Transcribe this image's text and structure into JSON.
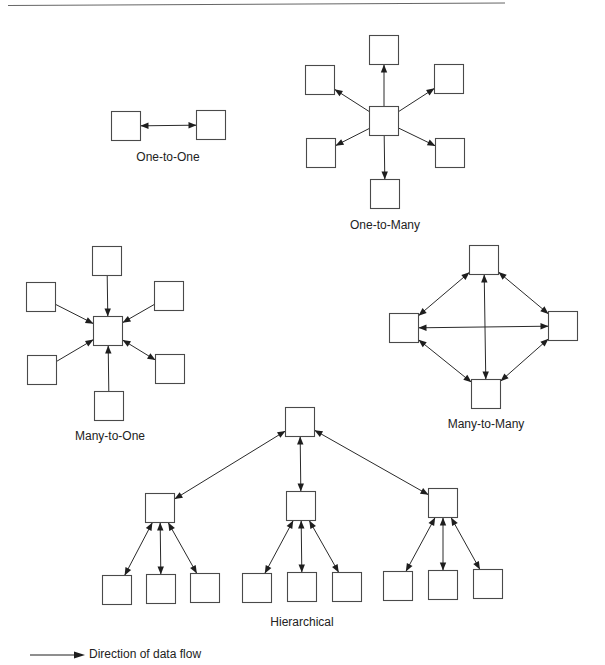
{
  "diagrams": {
    "one_to_one": {
      "label": "One-to-One",
      "center": [
        168,
        126
      ],
      "nodes": [
        [
          126,
          126
        ],
        [
          211,
          125
        ]
      ],
      "edges": [
        {
          "from": 0,
          "to": 1,
          "type": "both"
        }
      ]
    },
    "one_to_many": {
      "label": "One-to-Many",
      "hub": [
        384,
        121
      ],
      "leaves": [
        [
          384,
          50
        ],
        [
          320,
          80
        ],
        [
          449,
          79
        ],
        [
          321,
          153
        ],
        [
          450,
          153
        ],
        [
          385,
          194
        ]
      ],
      "edges_type": "out"
    },
    "many_to_one": {
      "label": "Many-to-One",
      "hub": [
        108,
        331
      ],
      "leaves": [
        [
          107,
          261
        ],
        [
          41,
          297
        ],
        [
          169,
          296
        ],
        [
          42,
          370
        ],
        [
          170,
          369
        ],
        [
          109,
          406
        ]
      ],
      "edges_type": [
        "in",
        "in",
        "in",
        "in",
        "both",
        "in"
      ],
      "edge_leaf_order_note": "upper-right link is bidirectional"
    },
    "many_to_many": {
      "label": "Many-to-Many",
      "nodes": [
        [
          484,
          260
        ],
        [
          404,
          328
        ],
        [
          563,
          326
        ],
        [
          486,
          394
        ]
      ],
      "edges": [
        [
          0,
          1
        ],
        [
          0,
          2
        ],
        [
          1,
          3
        ],
        [
          2,
          3
        ],
        [
          1,
          2
        ],
        [
          0,
          3
        ]
      ],
      "edges_type": "both"
    },
    "hierarchical": {
      "label": "Hierarchical",
      "root": [
        300,
        422
      ],
      "mid": [
        [
          160,
          508
        ],
        [
          301,
          506
        ],
        [
          443,
          503
        ]
      ],
      "leaves": [
        [
          [
            117,
            590
          ],
          [
            161,
            589
          ],
          [
            205,
            588
          ]
        ],
        [
          [
            257,
            588
          ],
          [
            302,
            587
          ],
          [
            347,
            587
          ]
        ],
        [
          [
            398,
            586
          ],
          [
            443,
            585
          ],
          [
            488,
            584
          ]
        ]
      ],
      "edges_type": "both"
    }
  },
  "legend": {
    "text": "Direction of data flow",
    "arrow_icon": "right-arrow-icon"
  },
  "style": {
    "stroke": "#2a2a2a",
    "box_stroke": "#4a4a4a",
    "box_size": 29
  }
}
